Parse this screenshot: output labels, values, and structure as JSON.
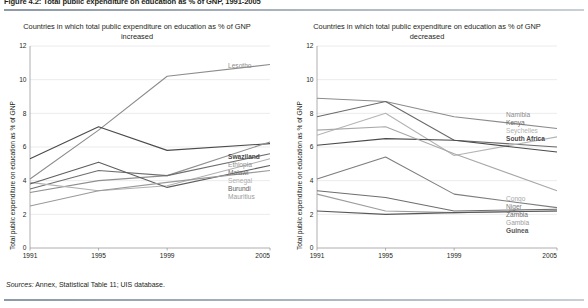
{
  "figure": {
    "title": "Figure 4.2: Total public expenditure on education as % of GNP, 1991-2005",
    "sources_label": "Sources:",
    "sources_text": "Annex, Statistical Table 11; UIS database."
  },
  "axis": {
    "ylabel": "Total public expenditure on education as % of GNP",
    "yticks": [
      "0",
      "2",
      "4",
      "6",
      "8",
      "10",
      "12"
    ],
    "xticks": [
      "1991",
      "1995",
      "1999",
      "2005"
    ]
  },
  "chart_data": [
    {
      "type": "line",
      "title": "Countries in which total public expenditure on education as % of GNP increased",
      "xlabel": "",
      "ylabel": "Total public expenditure on education as % of GNP",
      "x": [
        1991,
        1995,
        1999,
        2005
      ],
      "xlim": [
        1991,
        2005
      ],
      "ylim": [
        0,
        12
      ],
      "yticks": [
        0,
        2,
        4,
        6,
        8,
        10,
        12
      ],
      "grid": "horizontal",
      "legend": "right",
      "series": [
        {
          "name": "Lesotho",
          "values": [
            4.1,
            7.0,
            10.2,
            10.9
          ],
          "color": "#8c8c8c"
        },
        {
          "name": "Swaziland",
          "values": [
            5.3,
            7.2,
            5.8,
            6.2
          ],
          "color": "#4a4a4a"
        },
        {
          "name": "Ethiopia",
          "values": [
            3.3,
            4.0,
            4.3,
            6.3
          ],
          "color": "#8f8f8f"
        },
        {
          "name": "Malawi",
          "values": [
            3.5,
            4.6,
            4.3,
            5.6
          ],
          "color": "#6e6e6e"
        },
        {
          "name": "Senegal",
          "values": [
            3.9,
            3.4,
            3.7,
            5.3
          ],
          "color": "#b0b0b0"
        },
        {
          "name": "Burundi",
          "values": [
            3.8,
            5.1,
            3.6,
            4.9
          ],
          "color": "#5e5e5e"
        },
        {
          "name": "Mauritius",
          "values": [
            2.5,
            3.4,
            3.9,
            4.6
          ],
          "color": "#9a9a9a"
        }
      ]
    },
    {
      "type": "line",
      "title": "Countries in which total public expenditure on education as % of GNP decreased",
      "xlabel": "",
      "ylabel": "Total public expenditure on education as % of GNP",
      "x": [
        1991,
        1995,
        1999,
        2005
      ],
      "xlim": [
        1991,
        2005
      ],
      "ylim": [
        0,
        12
      ],
      "yticks": [
        0,
        2,
        4,
        6,
        8,
        10,
        12
      ],
      "grid": "horizontal",
      "legend": "right",
      "series": [
        {
          "name": "Namibia",
          "values": [
            8.9,
            8.7,
            7.8,
            7.1
          ],
          "color": "#8c8c8c"
        },
        {
          "name": "Kenya",
          "values": [
            7.8,
            8.7,
            6.4,
            6.0
          ],
          "color": "#6b6b6b"
        },
        {
          "name": "Seychelles",
          "values": [
            6.7,
            8.0,
            5.5,
            6.6
          ],
          "color": "#b4b4b4"
        },
        {
          "name": "South Africa",
          "values": [
            6.1,
            6.5,
            6.4,
            5.7
          ],
          "color": "#4a4a4a"
        },
        {
          "name": "Congo",
          "values": [
            7.0,
            7.2,
            5.6,
            3.4
          ],
          "color": "#a8a8a8"
        },
        {
          "name": "Niger",
          "values": [
            4.1,
            5.4,
            3.2,
            2.4
          ],
          "color": "#7d7d7d"
        },
        {
          "name": "Zambia",
          "values": [
            3.4,
            3.0,
            2.2,
            2.3
          ],
          "color": "#6e6e6e"
        },
        {
          "name": "Gambia",
          "values": [
            3.2,
            2.2,
            2.1,
            2.2
          ],
          "color": "#9d9d9d"
        },
        {
          "name": "Guinea",
          "values": [
            2.2,
            2.0,
            2.1,
            2.2
          ],
          "color": "#585858"
        }
      ]
    }
  ]
}
